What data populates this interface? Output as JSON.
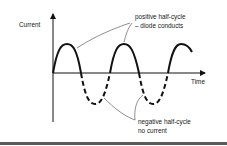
{
  "axes": {
    "y_label": "Current",
    "x_label": "Time"
  },
  "annotations": {
    "positive": {
      "line1": "positive half-cycle",
      "line2": "– diode conducts"
    },
    "negative": {
      "line1": "negative half-cycle",
      "line2": "no current"
    }
  },
  "legend_styles": {
    "positive_half_cycle": "solid line",
    "negative_half_cycle": "dashed line"
  },
  "colors": {
    "stroke": "#111111",
    "leader": "#444444",
    "background": "#ffffff"
  }
}
